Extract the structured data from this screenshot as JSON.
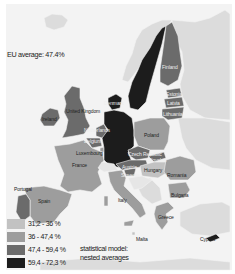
{
  "title": "EU average: 47.4%",
  "colors": {
    "background": "#f3f3f3",
    "non_eu": "#dcdcdc",
    "sea": "#f3f3f3",
    "class1": "#c2c2c2",
    "class2": "#9d9d9d",
    "class3": "#6b6b6b",
    "class4": "#1c1c1c"
  },
  "legend": {
    "items": [
      {
        "label": "31,2 - 36 %",
        "class": "class1"
      },
      {
        "label": "36 - 47,4 %",
        "class": "class2"
      },
      {
        "label": "47,4 - 59,4 %",
        "class": "class3"
      },
      {
        "label": "59,4 - 72,3 %",
        "class": "class4"
      }
    ],
    "model_line1": "statistical model:",
    "model_line2": "nested averages"
  },
  "countries": [
    {
      "name": "Ireland",
      "class": "class3"
    },
    {
      "name": "United Kingdom",
      "class": "class3"
    },
    {
      "name": "Denmark",
      "class": "class4"
    },
    {
      "name": "Sweden",
      "class": "class4"
    },
    {
      "name": "Finland",
      "class": "class3"
    },
    {
      "name": "Estonia",
      "class": "class3"
    },
    {
      "name": "Latvia",
      "class": "class3"
    },
    {
      "name": "Lithuania",
      "class": "class3"
    },
    {
      "name": "Netherlands",
      "class": "class3"
    },
    {
      "name": "Belgium",
      "class": "class3"
    },
    {
      "name": "Luxembourg",
      "class": "class2"
    },
    {
      "name": "France",
      "class": "class2"
    },
    {
      "name": "Germany",
      "class": "class4"
    },
    {
      "name": "Poland",
      "class": "class2"
    },
    {
      "name": "Czech Republic",
      "class": "class3"
    },
    {
      "name": "Slovakia",
      "class": "class3"
    },
    {
      "name": "Austria",
      "class": "class3"
    },
    {
      "name": "Slovenia",
      "class": "class3"
    },
    {
      "name": "Hungary",
      "class": "class1"
    },
    {
      "name": "Romania",
      "class": "class2"
    },
    {
      "name": "Bulgaria",
      "class": "class2"
    },
    {
      "name": "Greece",
      "class": "class2"
    },
    {
      "name": "Italy",
      "class": "class2"
    },
    {
      "name": "Malta",
      "class": "class1"
    },
    {
      "name": "Spain",
      "class": "class2"
    },
    {
      "name": "Portugal",
      "class": "class3"
    },
    {
      "name": "Cyprus",
      "class": "class4"
    }
  ],
  "labels": {
    "ireland": "Ireland",
    "uk": "United Kingdom",
    "denmark": "Denmark",
    "finland": "Finland",
    "estonia": "Estonia",
    "latvia": "Latvia",
    "lithuania": "Lithuania",
    "netherlands": "Netherlands",
    "belgium": "Belgium",
    "luxembourg": "Luxembourg",
    "france": "France",
    "poland": "Poland",
    "czech": "Czech Republic",
    "slovakia": "Slovakia",
    "austria": "Austria",
    "slovenia": "Slovenia",
    "hungary": "Hungary",
    "romania": "Romania",
    "bulgaria": "Bulgaria",
    "greece": "Greece",
    "italy": "Italy",
    "malta": "Malta",
    "spain": "Spain",
    "portugal": "Portugal",
    "cyprus": "Cyprus"
  }
}
